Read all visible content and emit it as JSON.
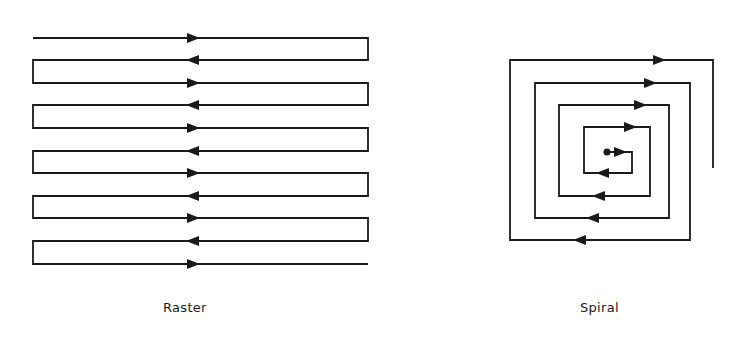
{
  "figure": {
    "stroke_color": "#1a1a1a",
    "background": "#ffffff",
    "panels": [
      {
        "id": "raster",
        "caption": "Raster",
        "caption_pos": [
          163,
          300
        ],
        "path_description": "Boustrophedon scan: 11 horizontal passes alternating direction, connected by vertical turns at alternating ends",
        "left_x": 33,
        "right_x": 368,
        "arrow_x": 193,
        "rows_y": [
          38,
          60,
          83,
          105,
          128,
          151,
          173,
          196,
          218,
          241,
          264
        ],
        "directions": [
          "right",
          "left",
          "right",
          "left",
          "right",
          "left",
          "right",
          "left",
          "right",
          "left",
          "right"
        ]
      },
      {
        "id": "spiral",
        "caption": "Spiral",
        "caption_pos": [
          580,
          300
        ],
        "path_description": "Square spiral starting at center dot, winding outward clockwise",
        "start_dot": [
          607,
          152
        ],
        "points": [
          [
            607,
            152
          ],
          [
            632,
            152
          ],
          [
            632,
            173
          ],
          [
            584,
            173
          ],
          [
            584,
            127
          ],
          [
            650,
            127
          ],
          [
            650,
            196
          ],
          [
            559,
            196
          ],
          [
            559,
            105
          ],
          [
            669,
            105
          ],
          [
            669,
            218
          ],
          [
            535,
            218
          ],
          [
            535,
            83
          ],
          [
            690,
            83
          ],
          [
            690,
            240
          ],
          [
            510,
            240
          ],
          [
            510,
            60
          ],
          [
            713,
            60
          ],
          [
            713,
            168
          ]
        ],
        "arrows": [
          {
            "x": 620,
            "y": 152,
            "dir": "right"
          },
          {
            "x": 603,
            "y": 173,
            "dir": "left"
          },
          {
            "x": 630,
            "y": 127,
            "dir": "right"
          },
          {
            "x": 599,
            "y": 196,
            "dir": "left"
          },
          {
            "x": 640,
            "y": 105,
            "dir": "right"
          },
          {
            "x": 593,
            "y": 218,
            "dir": "left"
          },
          {
            "x": 650,
            "y": 83,
            "dir": "right"
          },
          {
            "x": 580,
            "y": 240,
            "dir": "left"
          },
          {
            "x": 659,
            "y": 60,
            "dir": "right"
          }
        ]
      }
    ]
  }
}
